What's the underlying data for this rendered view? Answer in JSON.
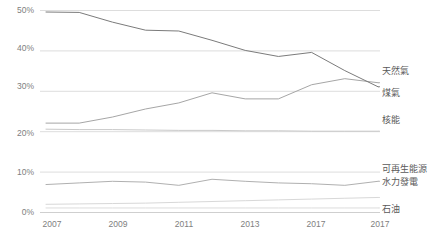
{
  "chart_data": {
    "type": "line",
    "title": "",
    "subtitle": "",
    "xlabel": "",
    "ylabel": "",
    "grid": true,
    "legend_position": "right-inline",
    "x": [
      2007,
      2008,
      2009,
      2010,
      2011,
      2012,
      2013,
      2014,
      2015,
      2016,
      2017
    ],
    "xtick_labels": [
      "2007",
      "2009",
      "2011",
      "2013",
      "2017",
      "2017"
    ],
    "xtick_values": [
      2007,
      2009,
      2011,
      2013,
      2015,
      2017
    ],
    "ytick_labels": [
      "0%",
      "10%",
      "20%",
      "30%",
      "40%",
      "50%"
    ],
    "ytick_values": [
      0,
      10,
      20,
      30,
      40,
      50
    ],
    "ylim": [
      0,
      51
    ],
    "xlim": [
      2007,
      2017
    ],
    "y_unit": "%",
    "series": [
      {
        "name": "煤氣",
        "color": "#7b7b7b",
        "values": [
          49.5,
          49.4,
          47.0,
          45.0,
          44.8,
          42.5,
          40.0,
          38.5,
          39.5,
          35.0,
          31.0
        ]
      },
      {
        "name": "天然氣",
        "color": "#a6a6a6",
        "values": [
          22.0,
          22.0,
          23.5,
          25.5,
          27.0,
          29.5,
          28.0,
          28.0,
          31.5,
          33.0,
          32.0
        ]
      },
      {
        "name": "核能",
        "color": "#c9c9c9",
        "values": [
          20.5,
          20.4,
          20.4,
          20.3,
          20.2,
          20.2,
          20.1,
          20.1,
          20.0,
          20.0,
          20.0
        ]
      },
      {
        "name": "可再生能源",
        "color": "#d8d8d8",
        "values": [
          1.9,
          2.0,
          2.1,
          2.2,
          2.4,
          2.6,
          2.8,
          3.0,
          3.2,
          3.4,
          3.6
        ]
      },
      {
        "name": "水力發電",
        "color": "#b0b0b0",
        "values": [
          6.8,
          7.2,
          7.6,
          7.4,
          6.6,
          8.1,
          7.6,
          7.2,
          7.0,
          6.6,
          7.6
        ]
      },
      {
        "name": "石油",
        "color": "#dcdcdc",
        "values": [
          1.0,
          1.0,
          1.0,
          1.0,
          1.0,
          1.0,
          1.0,
          1.0,
          1.0,
          1.0,
          1.0
        ]
      }
    ]
  },
  "legend": [
    {
      "label": "天然氣",
      "top": 66
    },
    {
      "label": "煤氣",
      "top": 88
    },
    {
      "label": "核能",
      "top": 115
    },
    {
      "label": "可再生能源",
      "top": 164
    },
    {
      "label": "水力發電",
      "top": 177
    },
    {
      "label": "石油",
      "top": 204
    }
  ],
  "axis": {
    "y_ticks": [
      {
        "label": "50%",
        "top": 5
      },
      {
        "label": "40%",
        "top": 43
      },
      {
        "label": "30%",
        "top": 81
      },
      {
        "label": "20%",
        "top": 128
      },
      {
        "label": "10%",
        "top": 167
      },
      {
        "label": "0%",
        "top": 207
      }
    ],
    "x_ticks": [
      {
        "label": "2007",
        "left": 52
      },
      {
        "label": "2009",
        "left": 118
      },
      {
        "label": "2011",
        "left": 184
      },
      {
        "label": "2013",
        "left": 250
      },
      {
        "label": "2017",
        "left": 316
      },
      {
        "label": "2017",
        "left": 380
      }
    ]
  },
  "colors": {
    "gridline": "#d9d9d9",
    "axis_text": "#808080",
    "legend_text": "#595959",
    "background": "#ffffff"
  }
}
